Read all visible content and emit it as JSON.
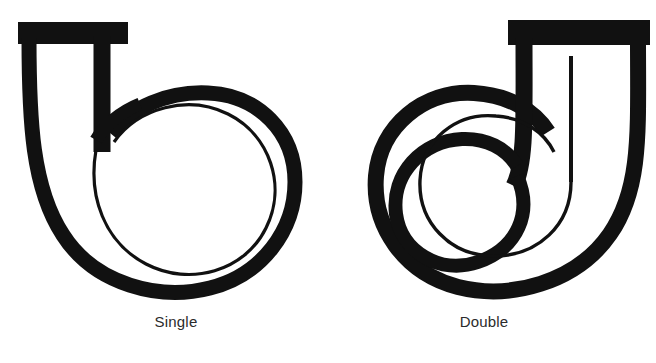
{
  "page": {
    "background_color": "#ffffff",
    "ink_color": "#111111",
    "caption_color": "#2b2b2b",
    "width": 656,
    "height": 363
  },
  "figures": [
    {
      "id": "single",
      "caption": "Single",
      "icon_name": "single-coil-icon",
      "description": "Tube with flanged inlet curving into one full loop"
    },
    {
      "id": "double",
      "caption": "Double",
      "icon_name": "double-coil-icon",
      "description": "Tube with flanged inlet spiralling into two loops"
    }
  ]
}
